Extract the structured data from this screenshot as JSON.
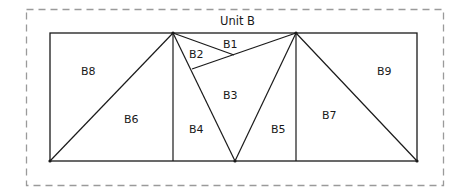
{
  "diagram": {
    "title": "Unit B",
    "colors": {
      "line": "#1a1a1a",
      "dashed_border": "#9a9a9a",
      "background": "#ffffff"
    },
    "regions": [
      {
        "id": "B1",
        "label": "B1"
      },
      {
        "id": "B2",
        "label": "B2"
      },
      {
        "id": "B3",
        "label": "B3"
      },
      {
        "id": "B4",
        "label": "B4"
      },
      {
        "id": "B5",
        "label": "B5"
      },
      {
        "id": "B6",
        "label": "B6"
      },
      {
        "id": "B7",
        "label": "B7"
      },
      {
        "id": "B8",
        "label": "B8"
      },
      {
        "id": "B9",
        "label": "B9"
      }
    ]
  }
}
